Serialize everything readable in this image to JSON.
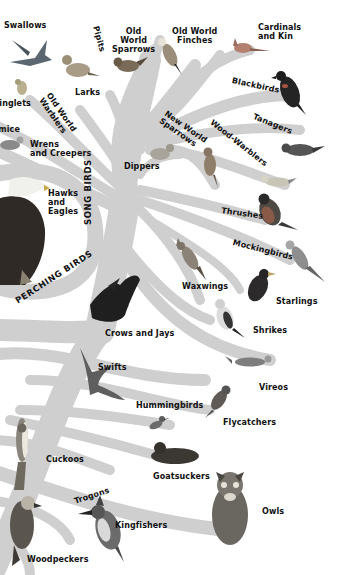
{
  "colors": {
    "branch": "#cfcfcf",
    "background": "#ffffff",
    "label": "#111111",
    "bird_dark": "#2b2b2b",
    "bird_mid": "#7a7a7a",
    "bird_light": "#bdbdbd",
    "bird_red": "#a5553f"
  },
  "groups": {
    "perching_birds": "PERCHING BIRDS",
    "song_birds": "SONG BIRDS"
  },
  "labels": {
    "swallows": "Swallows",
    "pipits": "Pipits",
    "old_world_sparrows": "Old\nWorld\nSparrows",
    "old_world_finches": "Old World\nFinches",
    "cardinals": "Cardinals\nand Kin",
    "larks": "Larks",
    "kinglets": "Kinglets",
    "old_world_warblers": "Old World\nWarblers",
    "titmice": "Titmice",
    "wrens": "Wrens\nand Creepers",
    "blackbirds": "Blackbirds",
    "tanagers": "Tanagers",
    "new_world_sparrows": "New World\nSparrows",
    "wood_warblers": "Wood-Warblers",
    "dippers": "Dippers",
    "hawks": "Hawks\nand\nEagles",
    "thrushes": "Thrushes",
    "mockingbirds": "Mockingbirds",
    "waxwings": "Waxwings",
    "starlings": "Starlings",
    "shrikes": "Shrikes",
    "crows": "Crows and Jays",
    "swifts": "Swifts",
    "vireos": "Vireos",
    "hummingbirds": "Hummingbirds",
    "flycatchers": "Flycatchers",
    "cuckoos": "Cuckoos",
    "goatsuckers": "Goatsuckers",
    "trogons": "Trogons",
    "owls": "Owls",
    "kingfishers": "Kingfishers",
    "woodpeckers": "Woodpeckers"
  },
  "birds": [
    {
      "id": "swallow",
      "name": "swallow-illustration"
    },
    {
      "id": "lark",
      "name": "lark-illustration"
    },
    {
      "id": "old-world-sparrow",
      "name": "old-world-sparrow-illustration"
    },
    {
      "id": "old-world-finch",
      "name": "old-world-finch-illustration"
    },
    {
      "id": "cardinal",
      "name": "cardinal-illustration"
    },
    {
      "id": "kinglet",
      "name": "kinglet-illustration"
    },
    {
      "id": "titmouse",
      "name": "titmouse-illustration"
    },
    {
      "id": "blackbird",
      "name": "blackbird-illustration"
    },
    {
      "id": "tanager",
      "name": "tanager-illustration"
    },
    {
      "id": "new-world-sparrow",
      "name": "new-world-sparrow-illustration"
    },
    {
      "id": "dipper",
      "name": "dipper-illustration"
    },
    {
      "id": "wood-warbler",
      "name": "wood-warbler-illustration"
    },
    {
      "id": "eagle",
      "name": "bald-eagle-illustration"
    },
    {
      "id": "thrush",
      "name": "thrush-illustration"
    },
    {
      "id": "mockingbird",
      "name": "mockingbird-illustration"
    },
    {
      "id": "waxwing",
      "name": "waxwing-illustration"
    },
    {
      "id": "starling",
      "name": "starling-illustration"
    },
    {
      "id": "shrike",
      "name": "shrike-illustration"
    },
    {
      "id": "crow",
      "name": "crow-illustration"
    },
    {
      "id": "swift",
      "name": "swift-illustration"
    },
    {
      "id": "vireo",
      "name": "vireo-illustration"
    },
    {
      "id": "hummingbird",
      "name": "hummingbird-illustration"
    },
    {
      "id": "flycatcher",
      "name": "flycatcher-illustration"
    },
    {
      "id": "cuckoo",
      "name": "cuckoo-illustration"
    },
    {
      "id": "goatsucker",
      "name": "goatsucker-illustration"
    },
    {
      "id": "owl",
      "name": "owl-illustration"
    },
    {
      "id": "kingfisher",
      "name": "kingfisher-illustration"
    },
    {
      "id": "woodpecker",
      "name": "woodpecker-illustration"
    }
  ]
}
